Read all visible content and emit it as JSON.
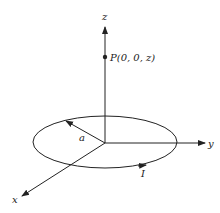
{
  "figure": {
    "axes": {
      "x_label": "x",
      "y_label": "y",
      "z_label": "z"
    },
    "point": {
      "label": "P(0, 0, z)"
    },
    "radius_label": "a",
    "current_label": "I",
    "colors": {
      "stroke": "#222222",
      "background": "#ffffff"
    }
  }
}
